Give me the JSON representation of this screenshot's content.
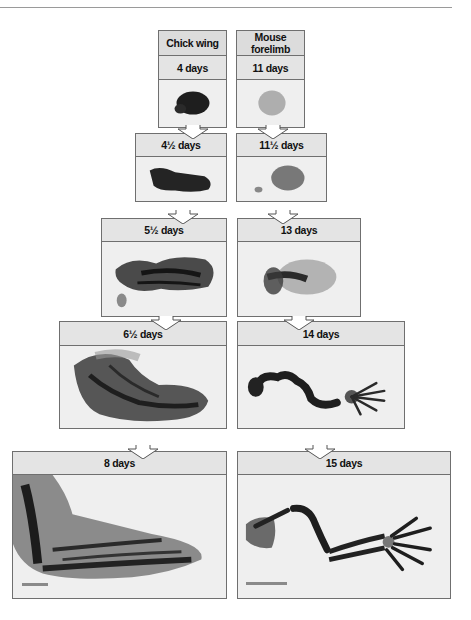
{
  "figure": {
    "columns": [
      {
        "title": "Chick wing",
        "stages": [
          "4 days",
          "4½  days",
          "5½  days",
          "6½ days",
          "8 days"
        ]
      },
      {
        "title": "Mouse forelimb",
        "stages": [
          "11 days",
          "11½  days",
          "13 days",
          "14 days",
          "15 days"
        ]
      }
    ],
    "icons": {
      "stage_arrow": "down-arrow-icon",
      "scale_bar": "scale-bar"
    },
    "colors": {
      "border": "#6f6f6f",
      "header_bg": "#dcdcdc",
      "label_bg": "#e4e4e4",
      "stain": "#2a2a2a"
    }
  }
}
